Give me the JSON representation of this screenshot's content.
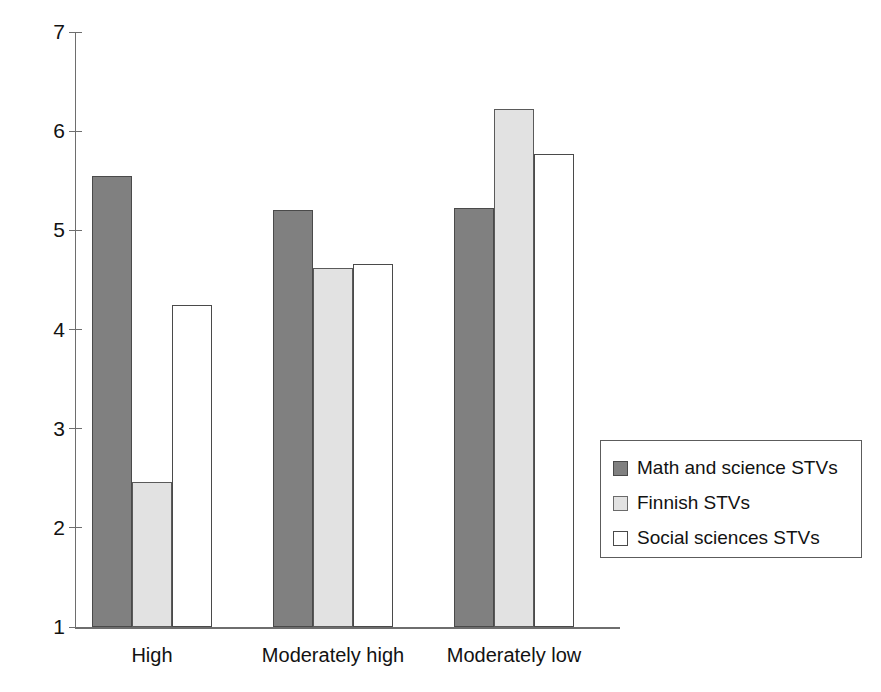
{
  "chart_data": {
    "type": "bar",
    "title": "",
    "subtitle": "",
    "xlabel": "",
    "ylabel": "",
    "categories": [
      "High",
      "Moderately high",
      "Moderately low"
    ],
    "series": [
      {
        "name": "Math and science STVs",
        "color": "#808080",
        "values": [
          5.55,
          5.21,
          5.23
        ]
      },
      {
        "name": "Finnish STVs",
        "color": "#e2e2e2",
        "values": [
          2.46,
          4.62,
          6.22
        ]
      },
      {
        "name": "Social sciences STVs",
        "color": "#ffffff",
        "values": [
          4.25,
          4.66,
          5.77
        ]
      }
    ],
    "ylim": [
      1,
      7
    ],
    "ytick_labels": [
      "7",
      "6",
      "5",
      "4",
      "3",
      "2",
      "1"
    ],
    "ytick_values": [
      7,
      6,
      5,
      4,
      3,
      2,
      1
    ],
    "grid": false,
    "legend_position": "right"
  },
  "legend": {
    "items": [
      {
        "label": "Math and science STVs",
        "swatch": "dark-gray-swatch"
      },
      {
        "label": "Finnish STVs",
        "swatch": "light-gray-swatch"
      },
      {
        "label": "Social sciences STVs",
        "swatch": "white-swatch"
      }
    ]
  },
  "axis": {
    "y_labels": [
      "7",
      "6",
      "5",
      "4",
      "3",
      "2",
      "1"
    ],
    "x_labels": [
      "High",
      "Moderately high",
      "Moderately low"
    ]
  }
}
